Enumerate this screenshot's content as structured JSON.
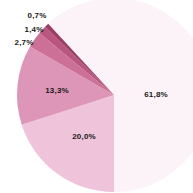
{
  "chart_data": {
    "type": "pie",
    "title": "",
    "slices": [
      {
        "label": "61,8%",
        "value": 61.8,
        "color": "#fcf3f8"
      },
      {
        "label": "20,0%",
        "value": 20.0,
        "color": "#efc3d9"
      },
      {
        "label": "13,3%",
        "value": 13.3,
        "color": "#dd96b8"
      },
      {
        "label": "2,7%",
        "value": 2.7,
        "color": "#cc7097"
      },
      {
        "label": "1,4%",
        "value": 1.4,
        "color": "#b8567f"
      },
      {
        "label": "0,7%",
        "value": 0.7,
        "color": "#9c3e66"
      }
    ],
    "start_angle_deg": 180,
    "direction": "clockwise-from-bottom",
    "legend": "none",
    "data_labels": true
  },
  "labels": {
    "s0": "61,8%",
    "s1": "20,0%",
    "s2": "13,3%",
    "s3": "2,7%",
    "s4": "1,4%",
    "s5": "0,7%"
  }
}
